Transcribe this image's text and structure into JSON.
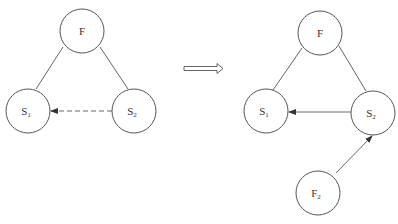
{
  "diagram": {
    "left": {
      "nodes": [
        {
          "id": "F",
          "label": "F",
          "sub": "",
          "cx": 82,
          "cy": 31,
          "r": 22
        },
        {
          "id": "S1",
          "label": "S",
          "sub": "1",
          "cx": 28,
          "cy": 111,
          "r": 22
        },
        {
          "id": "S2",
          "label": "S",
          "sub": "2",
          "cx": 134,
          "cy": 111,
          "r": 22
        }
      ],
      "edges": [
        {
          "from": "F",
          "to": "S1",
          "style": "solid",
          "arrow": false
        },
        {
          "from": "F",
          "to": "S2",
          "style": "solid",
          "arrow": false
        },
        {
          "from": "S2",
          "to": "S1",
          "style": "dashed",
          "arrow": true
        }
      ]
    },
    "transition_arrow": {
      "direction": "right",
      "style": "hollow-double"
    },
    "right": {
      "nodes": [
        {
          "id": "F",
          "label": "F",
          "sub": "",
          "cx": 320,
          "cy": 33,
          "r": 22
        },
        {
          "id": "S1",
          "label": "S",
          "sub": "1",
          "cx": 266,
          "cy": 111,
          "r": 22
        },
        {
          "id": "S2",
          "label": "S",
          "sub": "2",
          "cx": 373,
          "cy": 113,
          "r": 22
        },
        {
          "id": "F2",
          "label": "F",
          "sub": "2",
          "cx": 318,
          "cy": 193,
          "r": 22
        }
      ],
      "edges": [
        {
          "from": "F",
          "to": "S1",
          "style": "solid",
          "arrow": false
        },
        {
          "from": "F",
          "to": "S2",
          "style": "solid",
          "arrow": false
        },
        {
          "from": "S2",
          "to": "S1",
          "style": "solid",
          "arrow": true
        },
        {
          "from": "F2",
          "to": "S2",
          "style": "solid",
          "arrow": true
        }
      ]
    }
  }
}
